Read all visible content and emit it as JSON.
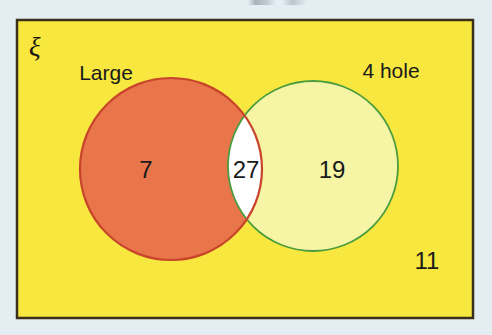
{
  "diagram": {
    "type": "venn-2-set",
    "universe_symbol": "ξ",
    "universe_label_name": "universal-set-symbol",
    "outer_rectangle": {
      "fill_color": "#f7e73f",
      "border_color": "#3a2f18",
      "x": 17,
      "y": 20,
      "width": 456,
      "height": 298
    },
    "page_background_color": "#e4edf2",
    "sets": [
      {
        "id": "large",
        "label": "Large",
        "fill_color": "#e8764a",
        "border_color": "#c8452c",
        "cx": 171,
        "cy": 169,
        "r": 91,
        "label_x": 106,
        "label_y": 80
      },
      {
        "id": "four-hole",
        "label": "4 hole",
        "fill_color": "#f6f5a6",
        "border_color": "#4a9c3e",
        "cx": 313,
        "cy": 166,
        "r": 85,
        "label_x": 391,
        "label_y": 78
      }
    ],
    "intersection": {
      "fill_color": "#ffffff",
      "border_color": "#c8452c"
    },
    "regions": [
      {
        "id": "large-only",
        "name": "large-only-count",
        "value": "7",
        "x": 146,
        "y": 178
      },
      {
        "id": "intersection",
        "name": "intersection-count",
        "value": "27",
        "x": 246,
        "y": 178
      },
      {
        "id": "four-hole-only",
        "name": "four-hole-only-count",
        "value": "19",
        "x": 332,
        "y": 178
      },
      {
        "id": "outside",
        "name": "outside-count",
        "value": "11",
        "x": 427,
        "y": 269
      }
    ]
  },
  "chart_data": {
    "type": "venn",
    "title": "",
    "set_names": [
      "Large",
      "4 hole"
    ],
    "universe": "ξ",
    "regions": {
      "Large only": 7,
      "Large and 4 hole": 27,
      "4 hole only": 19,
      "Neither": 11
    },
    "values": [
      7,
      27,
      19,
      11
    ],
    "categories": [
      "Large only",
      "Large and 4 hole",
      "4 hole only",
      "Neither"
    ],
    "totals": {
      "Large": 34,
      "4 hole": 46,
      "universe": 64
    }
  }
}
